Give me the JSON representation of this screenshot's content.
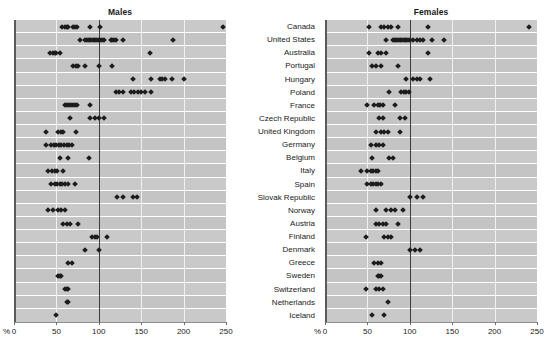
{
  "panels": {
    "males": {
      "title": "Males"
    },
    "females": {
      "title": "Females"
    }
  },
  "axis": {
    "unit_label": "%",
    "ticks": [
      0,
      50,
      100,
      150,
      200,
      250
    ],
    "tick_labels": [
      "0",
      "50",
      "100",
      "150",
      "200",
      "250"
    ],
    "min": 0,
    "max": 250,
    "reference_value": 100
  },
  "countries": [
    "Canada",
    "United States",
    "Australia",
    "Portugal",
    "Hungary",
    "Poland",
    "France",
    "Czech Republic",
    "United Kingdom",
    "Germany",
    "Belgium",
    "Italy",
    "Spain",
    "Slovak Republic",
    "Norway",
    "Austria",
    "Finland",
    "Denmark",
    "Greece",
    "Sweden",
    "Switzerland",
    "Netherlands",
    "Iceland"
  ],
  "chart_data": {
    "type": "scatter",
    "title": "",
    "subtitle": "",
    "xlabel": "%",
    "ylabel": "",
    "xlim": [
      0,
      250
    ],
    "grid": true,
    "legend": "none",
    "reference_line": 100,
    "panels": [
      "Males",
      "Females"
    ],
    "categories": [
      "Canada",
      "United States",
      "Australia",
      "Portugal",
      "Hungary",
      "Poland",
      "France",
      "Czech Republic",
      "United Kingdom",
      "Germany",
      "Belgium",
      "Italy",
      "Spain",
      "Slovak Republic",
      "Norway",
      "Austria",
      "Finland",
      "Denmark",
      "Greece",
      "Sweden",
      "Switzerland",
      "Netherlands",
      "Iceland"
    ],
    "series": [
      {
        "name": "Males",
        "values_by_category": {
          "Canada": [
            57,
            60,
            62,
            64,
            70,
            72,
            74,
            90,
            102,
            246
          ],
          "United States": [
            78,
            84,
            86,
            88,
            90,
            92,
            94,
            96,
            98,
            100,
            102,
            104,
            106,
            114,
            116,
            118,
            120,
            128,
            188
          ],
          "Australia": [
            43,
            46,
            48,
            50,
            54,
            160
          ],
          "Portugal": [
            70,
            73,
            75,
            84,
            100,
            116
          ],
          "Hungary": [
            140,
            162,
            172,
            175,
            178,
            186,
            200
          ],
          "Poland": [
            120,
            124,
            128,
            138,
            142,
            146,
            150,
            154,
            162
          ],
          "France": [
            60,
            63,
            65,
            67,
            69,
            72,
            74,
            90
          ],
          "Czech Republic": [
            66,
            90,
            95,
            100,
            106
          ],
          "United Kingdom": [
            38,
            52,
            55,
            58,
            73
          ],
          "Germany": [
            38,
            44,
            47,
            50,
            53,
            56,
            59,
            62,
            65,
            68
          ],
          "Belgium": [
            54,
            64,
            88
          ],
          "Italy": [
            40,
            45,
            48,
            51,
            58
          ],
          "Spain": [
            44,
            48,
            51,
            54,
            57,
            60,
            64,
            72
          ],
          "Slovak Republic": [
            122,
            128,
            140,
            145
          ],
          "Norway": [
            40,
            46,
            52,
            56,
            60
          ],
          "Austria": [
            58,
            62,
            66,
            76
          ],
          "Finland": [
            92,
            95,
            98,
            110
          ],
          "Denmark": [
            84,
            100
          ],
          "Greece": [
            64,
            68
          ],
          "Sweden": [
            52,
            54,
            56
          ],
          "Switzerland": [
            60,
            62,
            64
          ],
          "Netherlands": [
            62,
            64
          ],
          "Iceland": [
            50
          ]
        }
      },
      {
        "name": "Females",
        "values_by_category": {
          "Canada": [
            52,
            66,
            70,
            74,
            78,
            86,
            122,
            240
          ],
          "United States": [
            72,
            80,
            82,
            84,
            86,
            88,
            90,
            92,
            94,
            96,
            98,
            100,
            104,
            108,
            112,
            116,
            126,
            140
          ],
          "Australia": [
            52,
            62,
            66,
            72,
            122
          ],
          "Portugal": [
            56,
            60,
            66,
            86
          ],
          "Hungary": [
            96,
            104,
            108,
            112,
            124
          ],
          "Poland": [
            76,
            90,
            93,
            96,
            99
          ],
          "France": [
            50,
            58,
            62,
            65,
            68,
            82
          ],
          "Czech Republic": [
            64,
            68,
            88,
            94
          ],
          "United Kingdom": [
            60,
            66,
            70,
            74,
            88
          ],
          "Germany": [
            54,
            60,
            64,
            68
          ],
          "Belgium": [
            56,
            76,
            80
          ],
          "Italy": [
            42,
            50,
            54,
            57,
            60,
            63
          ],
          "Spain": [
            50,
            54,
            57,
            60,
            63,
            66
          ],
          "Slovak Republic": [
            100,
            108,
            116
          ],
          "Norway": [
            60,
            72,
            78,
            82,
            92
          ],
          "Austria": [
            60,
            64,
            68,
            72,
            86
          ],
          "Finland": [
            48,
            70,
            74,
            78
          ],
          "Denmark": [
            100,
            106,
            112
          ],
          "Greece": [
            58,
            62,
            66
          ],
          "Sweden": [
            62,
            64,
            66
          ],
          "Switzerland": [
            48,
            60,
            64,
            68
          ],
          "Netherlands": [
            74
          ],
          "Iceland": [
            56,
            70
          ]
        }
      }
    ]
  }
}
